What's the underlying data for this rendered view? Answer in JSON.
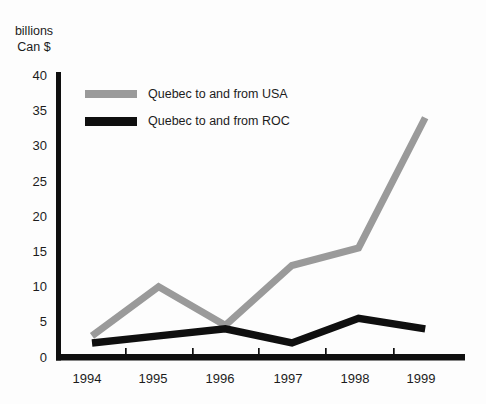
{
  "y_axis_label": {
    "line1": "billions",
    "line2": "Can $"
  },
  "chart_data": {
    "type": "line",
    "title": "",
    "ylabel": "billions Can $",
    "xlabel": "",
    "categories": [
      "1994",
      "1995",
      "1996",
      "1997",
      "1998",
      "1999"
    ],
    "series": [
      {
        "name": "Quebec to and from USA",
        "color": "#9a9a9a",
        "values": [
          3,
          10,
          4.5,
          13,
          15.5,
          34
        ]
      },
      {
        "name": "Quebec to and from ROC",
        "color": "#0f0f0f",
        "values": [
          2,
          3,
          4,
          2,
          5.5,
          4
        ]
      }
    ],
    "ylim": [
      0,
      40
    ],
    "yticks": [
      0,
      5,
      10,
      15,
      20,
      25,
      30,
      35,
      40
    ],
    "grid": false,
    "legend_position": "top-left-inside",
    "axis_color": "#0f0f0f",
    "text_color": "#1c1c1c"
  }
}
